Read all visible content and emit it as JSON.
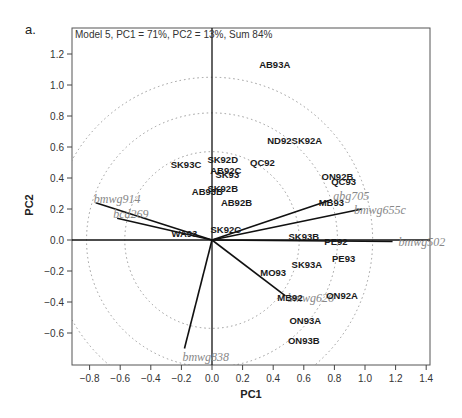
{
  "panel_label": "a.",
  "chart_data": {
    "type": "scatter",
    "subtype": "PCA biplot",
    "title": "Model 5, PC1 = 71%, PC2 = 13%, Sum 84%",
    "xlabel": "PC1",
    "ylabel": "PC2",
    "xlim": [
      -0.92,
      1.42
    ],
    "ylim": [
      -0.79,
      1.32
    ],
    "xticks": [
      "-0.8",
      "-0.6",
      "-0.4",
      "-0.2",
      "0.0",
      "0.2",
      "0.4",
      "0.6",
      "0.8",
      "1.0",
      "1.2",
      "1.4"
    ],
    "yticks": [
      "-0.6",
      "-0.4",
      "-0.2",
      "0.0",
      "0.2",
      "0.4",
      "0.6",
      "0.8",
      "1.0",
      "1.2"
    ],
    "grid": false,
    "reference_circles": [
      0.57,
      0.82,
      1.05
    ],
    "points": [
      {
        "label": "AB93A",
        "x": 0.41,
        "y": 1.13
      },
      {
        "label": "ND92",
        "x": 0.44,
        "y": 0.64
      },
      {
        "label": "SK92A",
        "x": 0.62,
        "y": 0.64
      },
      {
        "label": "SK93C",
        "x": -0.17,
        "y": 0.49
      },
      {
        "label": "SK92D",
        "x": 0.07,
        "y": 0.52
      },
      {
        "label": "QC92",
        "x": 0.33,
        "y": 0.5
      },
      {
        "label": "AB92C",
        "x": 0.09,
        "y": 0.45
      },
      {
        "label": "SK93",
        "x": 0.1,
        "y": 0.42
      },
      {
        "label": "SK92B",
        "x": 0.07,
        "y": 0.33
      },
      {
        "label": "AB93B",
        "x": -0.03,
        "y": 0.31
      },
      {
        "label": "AB92B",
        "x": 0.16,
        "y": 0.24
      },
      {
        "label": "ON92B",
        "x": 0.82,
        "y": 0.41
      },
      {
        "label": "QC93",
        "x": 0.86,
        "y": 0.38
      },
      {
        "label": "MB93",
        "x": 0.78,
        "y": 0.24
      },
      {
        "label": "SK92C",
        "x": 0.09,
        "y": 0.07
      },
      {
        "label": "WA93",
        "x": -0.18,
        "y": 0.04
      },
      {
        "label": "SK93B",
        "x": 0.6,
        "y": 0.02
      },
      {
        "label": "PE92",
        "x": 0.81,
        "y": -0.01
      },
      {
        "label": "PE93",
        "x": 0.86,
        "y": -0.12
      },
      {
        "label": "SK93A",
        "x": 0.62,
        "y": -0.16
      },
      {
        "label": "MO93",
        "x": 0.4,
        "y": -0.21
      },
      {
        "label": "MB92",
        "x": 0.51,
        "y": -0.37
      },
      {
        "label": "ON92A",
        "x": 0.85,
        "y": -0.36
      },
      {
        "label": "ON93A",
        "x": 0.61,
        "y": -0.52
      },
      {
        "label": "ON93B",
        "x": 0.6,
        "y": -0.65
      }
    ],
    "vectors": [
      {
        "label": "bmwg914",
        "x": -0.76,
        "y": 0.24
      },
      {
        "label": "bcd269",
        "x": -0.62,
        "y": 0.14
      },
      {
        "label": "bmwg838",
        "x": -0.18,
        "y": -0.7
      },
      {
        "label": "bmwg626",
        "x": 0.48,
        "y": -0.36
      },
      {
        "label": "abg705",
        "x": 0.78,
        "y": 0.26
      },
      {
        "label": "bmwg655c",
        "x": 0.98,
        "y": 0.2
      },
      {
        "label": "bmwg502",
        "x": 1.18,
        "y": -0.01
      }
    ]
  }
}
